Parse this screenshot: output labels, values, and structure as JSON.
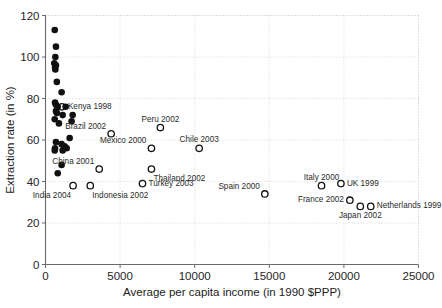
{
  "chart_data": {
    "type": "scatter",
    "title": "",
    "xlabel": "Average per capita income (in 1990 $PPP)",
    "ylabel": "Extraction rate (in %)",
    "xlim": [
      0,
      25000
    ],
    "ylim": [
      0,
      120
    ],
    "xticks": [
      0,
      5000,
      10000,
      15000,
      20000,
      25000
    ],
    "yticks": [
      0,
      20,
      40,
      60,
      80,
      100,
      120
    ],
    "xtick_labels": [
      "0",
      "5000",
      "10000",
      "15000",
      "20000",
      "25000"
    ],
    "ytick_labels": [
      "0",
      "20",
      "40",
      "60",
      "80",
      "100",
      "120"
    ],
    "grid": true,
    "legend": "none",
    "series": [
      {
        "name": "unlabelled-observations",
        "marker": "filled-circle",
        "color": "#111111",
        "points": [
          {
            "x": 620,
            "y": 113
          },
          {
            "x": 700,
            "y": 105
          },
          {
            "x": 660,
            "y": 100
          },
          {
            "x": 590,
            "y": 97
          },
          {
            "x": 700,
            "y": 96
          },
          {
            "x": 640,
            "y": 95
          },
          {
            "x": 660,
            "y": 94
          },
          {
            "x": 760,
            "y": 88
          },
          {
            "x": 1080,
            "y": 83
          },
          {
            "x": 640,
            "y": 78
          },
          {
            "x": 700,
            "y": 77
          },
          {
            "x": 820,
            "y": 76
          },
          {
            "x": 1350,
            "y": 76
          },
          {
            "x": 700,
            "y": 74
          },
          {
            "x": 760,
            "y": 73
          },
          {
            "x": 1150,
            "y": 72
          },
          {
            "x": 620,
            "y": 70
          },
          {
            "x": 1820,
            "y": 72
          },
          {
            "x": 900,
            "y": 68
          },
          {
            "x": 1750,
            "y": 69
          },
          {
            "x": 1620,
            "y": 61
          },
          {
            "x": 700,
            "y": 59
          },
          {
            "x": 1080,
            "y": 58
          },
          {
            "x": 1280,
            "y": 57
          },
          {
            "x": 640,
            "y": 56
          },
          {
            "x": 1420,
            "y": 56
          },
          {
            "x": 620,
            "y": 55
          },
          {
            "x": 1150,
            "y": 55
          },
          {
            "x": 1080,
            "y": 48
          },
          {
            "x": 820,
            "y": 44
          }
        ]
      },
      {
        "name": "labelled-countries",
        "marker": "open-circle",
        "color": "#111111",
        "points": [
          {
            "x": 1100,
            "y": 76,
            "label": "Kenya 1998",
            "label_pos": "right"
          },
          {
            "x": 4400,
            "y": 63,
            "label": "Brazil 2002",
            "label_pos": "above-left"
          },
          {
            "x": 7700,
            "y": 66,
            "label": "Peru 2002",
            "label_pos": "above"
          },
          {
            "x": 10300,
            "y": 56,
            "label": "Chile 2003",
            "label_pos": "above"
          },
          {
            "x": 7100,
            "y": 56,
            "label": "Mexico 2000",
            "label_pos": "above-left"
          },
          {
            "x": 3600,
            "y": 46,
            "label": "China 2001",
            "label_pos": "above-left"
          },
          {
            "x": 7100,
            "y": 46,
            "label": "Thailand 2002",
            "label_pos": "below-right"
          },
          {
            "x": 6500,
            "y": 39,
            "label": "Turkey 2003",
            "label_pos": "right"
          },
          {
            "x": 1850,
            "y": 38,
            "label": "India 2004",
            "label_pos": "below-left"
          },
          {
            "x": 3000,
            "y": 38,
            "label": "Indonesia 2002",
            "label_pos": "below-right"
          },
          {
            "x": 14700,
            "y": 34,
            "label": "Spain 2000",
            "label_pos": "above-left"
          },
          {
            "x": 18500,
            "y": 38,
            "label": "Italy 2000",
            "label_pos": "above"
          },
          {
            "x": 19800,
            "y": 39,
            "label": "UK 1999",
            "label_pos": "right"
          },
          {
            "x": 20400,
            "y": 31,
            "label": "France 2002",
            "label_pos": "left"
          },
          {
            "x": 21100,
            "y": 28,
            "label": "Japan 2002",
            "label_pos": "below"
          },
          {
            "x": 21800,
            "y": 28,
            "label": "Netherlands 1999",
            "label_pos": "right"
          }
        ]
      }
    ]
  },
  "axes": {
    "x_title": "Average per capita income (in 1990 $PPP)",
    "y_title": "Extraction rate (in %)"
  }
}
